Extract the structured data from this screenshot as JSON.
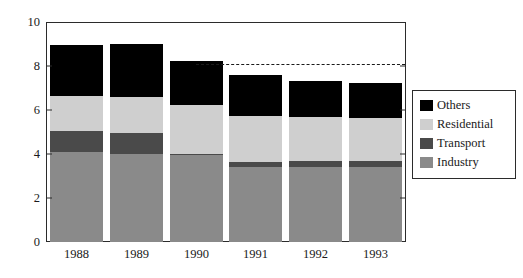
{
  "chart_data": {
    "type": "bar",
    "subtype": "stacked",
    "title": "",
    "xlabel": "",
    "ylabel": "",
    "categories": [
      "1988",
      "1989",
      "1990",
      "1991",
      "1992",
      "1993"
    ],
    "series": [
      {
        "name": "Industry",
        "color": "#8a8a8a",
        "values": [
          4.1,
          4.0,
          3.95,
          3.4,
          3.4,
          3.4
        ]
      },
      {
        "name": "Transport",
        "color": "#4a4a4a",
        "values": [
          0.95,
          0.95,
          0.05,
          0.25,
          0.3,
          0.3
        ]
      },
      {
        "name": "Residential",
        "color": "#cfcfcf",
        "values": [
          1.6,
          1.65,
          2.25,
          2.1,
          2.0,
          1.95
        ]
      },
      {
        "name": "Others",
        "color": "#000000",
        "values": [
          2.3,
          2.4,
          2.0,
          1.85,
          1.6,
          1.6
        ]
      }
    ],
    "totals": [
      8.95,
      9.0,
      8.25,
      7.6,
      7.3,
      7.25
    ],
    "stack_order": [
      "Industry",
      "Transport",
      "Residential",
      "Others"
    ],
    "ylim": [
      0,
      10
    ],
    "yticks": [
      0,
      2,
      4,
      6,
      8,
      10
    ],
    "ytick_labels": [
      "0",
      "2",
      "4",
      "6",
      "8",
      "10"
    ],
    "grid": false,
    "legend_position": "right",
    "legend_entries": [
      "Others",
      "Residential",
      "Transport",
      "Industry"
    ],
    "reference_line": {
      "value": 8.1,
      "style": "dashed",
      "color": "#1a1a1a",
      "x_start": "1990",
      "x_end": "1993"
    }
  }
}
